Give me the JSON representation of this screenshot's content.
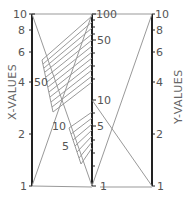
{
  "diagram": {
    "type": "nomograph",
    "left_axis": {
      "title": "X-VALUES",
      "ticks": [
        {
          "label": "10",
          "value": 10
        },
        {
          "label": "8",
          "value": 8
        },
        {
          "label": "6",
          "value": 6
        },
        {
          "label": "4",
          "value": 4
        },
        {
          "label": "2",
          "value": 2
        },
        {
          "label": "1",
          "value": 1
        }
      ]
    },
    "middle_axis": {
      "ticks": [
        {
          "label": "100",
          "value": 100
        },
        {
          "label": "50",
          "value": 50
        },
        {
          "label": "10",
          "value": 10
        },
        {
          "label": "5",
          "value": 5
        },
        {
          "label": "1",
          "value": 1
        }
      ]
    },
    "right_axis": {
      "title": "Y-VALUES",
      "ticks": [
        {
          "label": "10",
          "value": 10
        },
        {
          "label": "8",
          "value": 8
        },
        {
          "label": "6",
          "value": 6
        },
        {
          "label": "4",
          "value": 4
        },
        {
          "label": "2",
          "value": 2
        },
        {
          "label": "1",
          "value": 1
        }
      ]
    },
    "hatch_labels": {
      "upper": "50",
      "lower_a": "10",
      "lower_b": "5"
    },
    "colors": {
      "axis": "#222222",
      "line": "#999999",
      "text": "#555555"
    }
  }
}
